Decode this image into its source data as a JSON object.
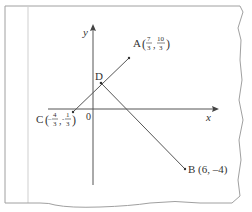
{
  "diagram": {
    "axes": {
      "x_label": "x",
      "y_label": "y",
      "origin_label": "0"
    },
    "points": {
      "A": {
        "name": "A",
        "coords_text": "(7/3, 10/3)",
        "x_num": "7",
        "x_den": "3",
        "y_num": "10",
        "y_den": "3"
      },
      "B": {
        "name": "B",
        "coords_text": "(6, –4)",
        "label": "B (6, –4)"
      },
      "C": {
        "name": "C",
        "coords_text": "(–4/3, –1/3)",
        "x_sign": "–",
        "x_num": "4",
        "x_den": "3",
        "y_sign": "-",
        "y_num": "1",
        "y_den": "3"
      },
      "D": {
        "name": "D"
      }
    },
    "segments": [
      "CA",
      "DB"
    ],
    "colors": {
      "line": "#555555",
      "text": "#333333",
      "frame": "#999999"
    }
  }
}
